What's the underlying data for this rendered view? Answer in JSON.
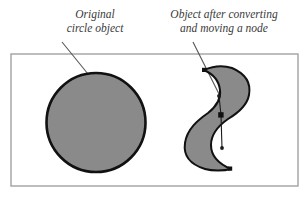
{
  "figure": {
    "captions": {
      "left": {
        "line1": "Original",
        "line2": "circle object"
      },
      "right": {
        "line1": "Object after converting",
        "line2": "and moving a node"
      }
    },
    "colors": {
      "shape_fill": "#8a8a8a",
      "shape_stroke": "#111111",
      "frame_border": "#9a9a9a",
      "leader_line": "#555555",
      "node_handle": "#1a1a1a",
      "caption_text": "#3a3a3a",
      "background": "#ffffff"
    },
    "frame": {
      "x": 11,
      "y": 54,
      "width": 287,
      "height": 132
    },
    "shapes": [
      {
        "name": "original-circle",
        "type": "circle",
        "cx": 96,
        "cy": 122.5,
        "r": 49.5
      },
      {
        "name": "converted-crescent",
        "type": "path",
        "d": "M 232 68 C 246 74 251 84 249 95 C 247 106 238 113 228 119 C 218 126 211 134 211 145 C 211 156 219 164 231 169 C 224 171 212 171 205 169 C 192 165 183 157 185 143 C 187 129 198 120 208 113 C 217 106 221 98 220 90 C 219 81 213 74 204 70 C 213 66 223 65 232 68 Z"
      }
    ],
    "node_editing": {
      "selected_node": {
        "x": 221,
        "y": 115
      },
      "handle_top": {
        "x": 219,
        "y": 96
      },
      "handle_bottom": {
        "x": 222,
        "y": 148
      },
      "extra_nodes": [
        {
          "x": 230,
          "y": 169
        },
        {
          "x": 204,
          "y": 70
        }
      ]
    },
    "leaders": [
      {
        "name": "leader-left",
        "x1": 62,
        "y1": 42,
        "x2": 88,
        "y2": 74
      },
      {
        "name": "leader-right",
        "x1": 193,
        "y1": 42,
        "x2": 222,
        "y2": 100
      }
    ]
  }
}
